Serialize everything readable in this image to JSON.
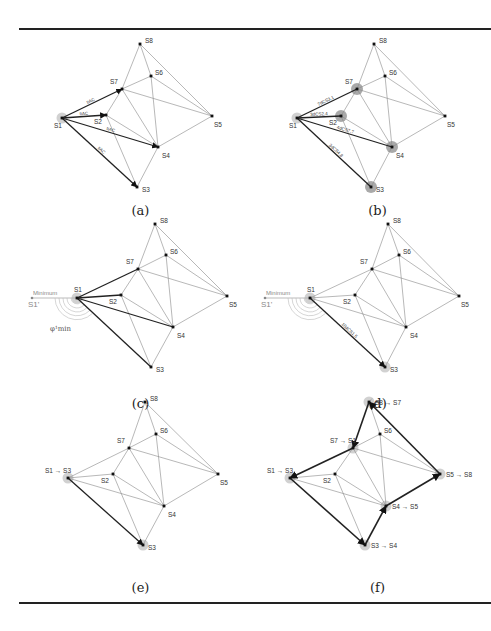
{
  "figure": {
    "nodes": [
      {
        "id": "S1",
        "label": "S1"
      },
      {
        "id": "S2",
        "label": "S2"
      },
      {
        "id": "S3",
        "label": "S3"
      },
      {
        "id": "S4",
        "label": "S4"
      },
      {
        "id": "S5",
        "label": "S5"
      },
      {
        "id": "S6",
        "label": "S6"
      },
      {
        "id": "S7",
        "label": "S7"
      },
      {
        "id": "S8",
        "label": "S8"
      }
    ],
    "edges": [
      [
        "S1",
        "S7"
      ],
      [
        "S1",
        "S2"
      ],
      [
        "S1",
        "S4"
      ],
      [
        "S1",
        "S3"
      ],
      [
        "S2",
        "S7"
      ],
      [
        "S2",
        "S4"
      ],
      [
        "S2",
        "S3"
      ],
      [
        "S7",
        "S8"
      ],
      [
        "S7",
        "S6"
      ],
      [
        "S7",
        "S4"
      ],
      [
        "S7",
        "S5"
      ],
      [
        "S8",
        "S6"
      ],
      [
        "S8",
        "S5"
      ],
      [
        "S6",
        "S4"
      ],
      [
        "S6",
        "S5"
      ],
      [
        "S4",
        "S5"
      ],
      [
        "S4",
        "S3"
      ]
    ],
    "panels": [
      {
        "caption": "(a)",
        "source": "S1",
        "highlighted_nodes": [
          "S1"
        ],
        "bold_edges": [
          {
            "from": "S1",
            "to": "S7",
            "label": "tiAC"
          },
          {
            "from": "S1",
            "to": "S2",
            "label": "tiAC"
          },
          {
            "from": "S1",
            "to": "S4",
            "label": "tiAC"
          },
          {
            "from": "S1",
            "to": "S3",
            "label": "tiAC"
          }
        ]
      },
      {
        "caption": "(b)",
        "source": "S1",
        "highlighted_nodes": [
          "S1",
          "S7",
          "S2",
          "S4",
          "S3"
        ],
        "bold_edges": [
          {
            "from": "S1",
            "to": "S7",
            "label": "7dCS3,1"
          },
          {
            "from": "S1",
            "to": "S2",
            "label": "3dCS2,4"
          },
          {
            "from": "S1",
            "to": "S4",
            "label": "4dCS7,7"
          },
          {
            "from": "S1",
            "to": "S3",
            "label": "3dCS4,8"
          }
        ]
      },
      {
        "caption": "(c)",
        "source": "S1",
        "highlighted_nodes": [
          "S1"
        ],
        "bold_edges": [
          {
            "from": "S1",
            "to": "S7",
            "label": ""
          },
          {
            "from": "S1",
            "to": "S2",
            "label": ""
          },
          {
            "from": "S1",
            "to": "S4",
            "label": ""
          },
          {
            "from": "S1",
            "to": "S3",
            "label": ""
          }
        ],
        "ghost_node_label": "S1'",
        "minimum_label": "Minimum",
        "angle_label": "φ¹min"
      },
      {
        "caption": "(d)",
        "source": "S1",
        "highlighted_nodes": [
          "S1",
          "S3"
        ],
        "bold_edges": [
          {
            "from": "S1",
            "to": "S3",
            "label": "10dCS1,5"
          }
        ],
        "ghost_node_label": "S1'",
        "minimum_label": "Minimum"
      },
      {
        "caption": "(e)",
        "highlighted_nodes": [
          "S1",
          "S3"
        ],
        "bold_edges": [
          {
            "from": "S1",
            "to": "S3",
            "label": ""
          }
        ],
        "node_label_overrides": {
          "S1": "S1 → S3"
        }
      },
      {
        "caption": "(f)",
        "highlighted_nodes": [
          "S1",
          "S3",
          "S4",
          "S5",
          "S8",
          "S7"
        ],
        "bold_edges": [
          {
            "from": "S1",
            "to": "S3",
            "label": ""
          },
          {
            "from": "S3",
            "to": "S4",
            "label": ""
          },
          {
            "from": "S4",
            "to": "S5",
            "label": ""
          },
          {
            "from": "S5",
            "to": "S8",
            "label": ""
          },
          {
            "from": "S8",
            "to": "S7",
            "label": ""
          },
          {
            "from": "S7",
            "to": "S1",
            "label": ""
          }
        ],
        "node_label_overrides": {
          "S1": "S1 → S3",
          "S3": "S3 → S4",
          "S4": "S4 → S5",
          "S5": "S5 → S8",
          "S8": "S8 → S7",
          "S7": "S7 → S1"
        }
      }
    ]
  }
}
